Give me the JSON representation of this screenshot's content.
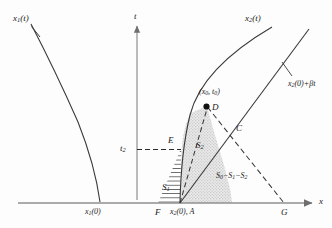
{
  "figure": {
    "type": "mathematical-diagram",
    "background_color": "#fdfdfd",
    "line_color": "#333333",
    "axis_color": "#8a8a8a",
    "shade_color": "#dedede"
  },
  "axes": {
    "vertical_label": "t",
    "horizontal_label": "x",
    "tick_label_t2": "t",
    "tick_label_t2_sub": "2"
  },
  "curves": {
    "left_curve_label": "x",
    "left_curve_label_sub": "1",
    "left_curve_label_tail": "(t)",
    "right_curve_label": "x",
    "right_curve_label_sub": "2",
    "right_curve_label_tail": "(t)",
    "line_label": "x",
    "line_label_sub": "2",
    "line_label_tail": "(0)+βt"
  },
  "points": {
    "origin_left": {
      "label": "x",
      "sub": "1",
      "tail": "(0)"
    },
    "base_left": {
      "label": "F"
    },
    "base_mid": {
      "label": "x",
      "sub": "2",
      "tail": "(0), A"
    },
    "base_right": {
      "label": "G"
    },
    "apex": {
      "label": "D"
    },
    "apex_coords": {
      "label": "(x",
      "sub": "0",
      "mid": ", t",
      "sub2": "0",
      "tail": ")"
    },
    "cross": {
      "label": "C"
    },
    "edge": {
      "label": "E"
    }
  },
  "regions": {
    "hatched": {
      "label": "S",
      "sub": "1"
    },
    "dotted": {
      "label": "S",
      "sub": "2"
    },
    "open": {
      "label": "S",
      "sub0": "0",
      "minus1": "−S",
      "sub1": "1",
      "minus2": "−S",
      "sub2": "2"
    }
  }
}
